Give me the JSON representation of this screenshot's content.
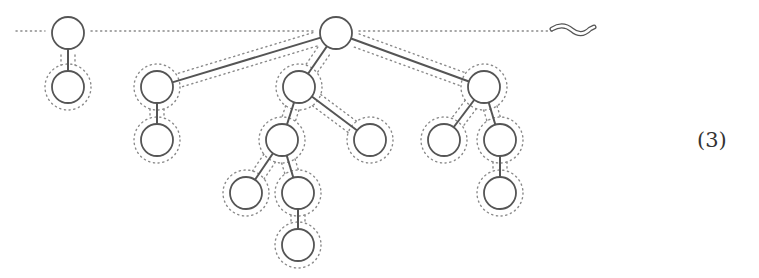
{
  "diagram": {
    "type": "forest-with-dotted-contours",
    "stroke_color": "#555555",
    "dotted_color": "#8a8a8a",
    "node_radius": 16,
    "baseline_y": 31,
    "baseline_start_x": 16,
    "baseline_end_x": 552,
    "wave_symbol": "squiggle-tail",
    "equation_label": "(3)",
    "nodes": [
      {
        "id": "A",
        "x": 68,
        "y": 33
      },
      {
        "id": "B",
        "x": 68,
        "y": 87
      },
      {
        "id": "R",
        "x": 336,
        "y": 33
      },
      {
        "id": "L1",
        "x": 157,
        "y": 87
      },
      {
        "id": "L1c",
        "x": 157,
        "y": 140
      },
      {
        "id": "M1",
        "x": 299,
        "y": 87
      },
      {
        "id": "M2",
        "x": 282,
        "y": 140
      },
      {
        "id": "M3",
        "x": 370,
        "y": 140
      },
      {
        "id": "M2a",
        "x": 246,
        "y": 193
      },
      {
        "id": "M2b",
        "x": 298,
        "y": 193
      },
      {
        "id": "M2bb",
        "x": 298,
        "y": 245
      },
      {
        "id": "R1",
        "x": 484,
        "y": 87
      },
      {
        "id": "R1a",
        "x": 444,
        "y": 140
      },
      {
        "id": "R1b",
        "x": 500,
        "y": 140
      },
      {
        "id": "R1bb",
        "x": 500,
        "y": 193
      }
    ],
    "edges": [
      [
        "A",
        "B"
      ],
      [
        "R",
        "L1"
      ],
      [
        "L1",
        "L1c"
      ],
      [
        "R",
        "M1"
      ],
      [
        "M1",
        "M2"
      ],
      [
        "M1",
        "M3"
      ],
      [
        "M2",
        "M2a"
      ],
      [
        "M2",
        "M2b"
      ],
      [
        "M2b",
        "M2bb"
      ],
      [
        "R",
        "R1"
      ],
      [
        "R1",
        "R1a"
      ],
      [
        "R1",
        "R1b"
      ],
      [
        "R1b",
        "R1bb"
      ]
    ]
  }
}
